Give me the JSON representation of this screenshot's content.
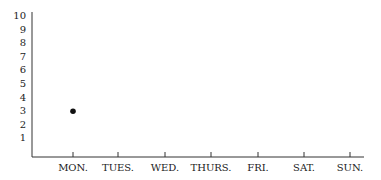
{
  "chart_data": {
    "type": "scatter",
    "title": "",
    "xlabel": "",
    "ylabel": "",
    "categories": [
      "MON.",
      "TUES.",
      "WED.",
      "THURS.",
      "FRI.",
      "SAT.",
      "SUN."
    ],
    "y_ticks": [
      "1",
      "2",
      "3",
      "4",
      "5",
      "6",
      "7",
      "8",
      "9",
      "10"
    ],
    "ylim": [
      0,
      10
    ],
    "grid": false,
    "series": [
      {
        "name": "points",
        "values": [
          3,
          null,
          null,
          null,
          null,
          null,
          null
        ]
      }
    ],
    "point_color": "#111111"
  }
}
